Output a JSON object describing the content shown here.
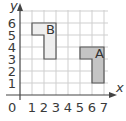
{
  "diagram": {
    "type": "coordinate-grid",
    "x_axis_label": "x",
    "y_axis_label": "y",
    "origin_label": "0",
    "x_ticks": [
      "1",
      "2",
      "3",
      "4",
      "5",
      "6",
      "7"
    ],
    "y_ticks": [
      "1",
      "2",
      "3",
      "4",
      "5",
      "6"
    ],
    "grid": {
      "x_min": 0,
      "x_max": 7,
      "y_min": 0,
      "y_max": 6
    },
    "shapes": [
      {
        "label": "B",
        "fill": "#eeeeee",
        "stroke": "#555555",
        "vertices": [
          [
            1,
            6
          ],
          [
            3,
            6
          ],
          [
            3,
            3
          ],
          [
            2,
            3
          ],
          [
            2,
            5
          ],
          [
            1,
            5
          ]
        ]
      },
      {
        "label": "A",
        "fill": "#c8c8c8",
        "stroke": "#555555",
        "vertices": [
          [
            5,
            4
          ],
          [
            7,
            4
          ],
          [
            7,
            1
          ],
          [
            6,
            1
          ],
          [
            6,
            3
          ],
          [
            5,
            3
          ]
        ]
      }
    ],
    "colors": {
      "grid": "#c8c8c8",
      "axis": "#444444",
      "text": "#3a3a3a"
    }
  }
}
